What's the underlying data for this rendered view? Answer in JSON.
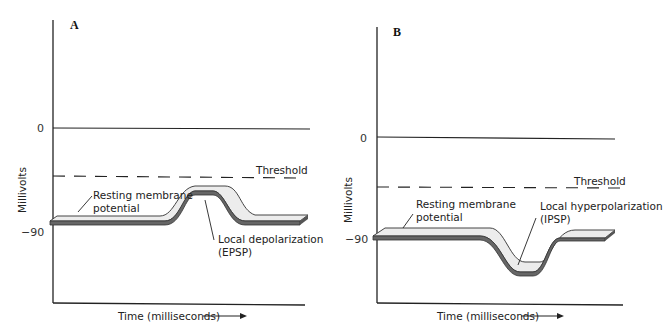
{
  "panels": [
    {
      "id": "A",
      "letter": "A",
      "y_axis_label": "Millivolts",
      "y_ticks": [
        "0",
        "−90"
      ],
      "threshold_label": "Threshold",
      "x_axis_label": "Time (milliseconds)",
      "resting_label_line1": "Resting membrane",
      "resting_label_line2": "potential",
      "event_label_line1": "Local depolarization",
      "event_label_line2": "(EPSP)"
    },
    {
      "id": "B",
      "letter": "B",
      "y_axis_label": "Millivolts",
      "y_ticks": [
        "0",
        "−90"
      ],
      "threshold_label": "Threshold",
      "x_axis_label": "Time (milliseconds)",
      "resting_label_line1": "Resting membrane",
      "resting_label_line2": "potential",
      "event_label_line1": "Local hyperpolarization",
      "event_label_line2": "(IPSP)"
    }
  ],
  "colors": {
    "ribbon_fill": "#ececec",
    "ribbon_edge": "#555555",
    "axis": "#222222"
  }
}
